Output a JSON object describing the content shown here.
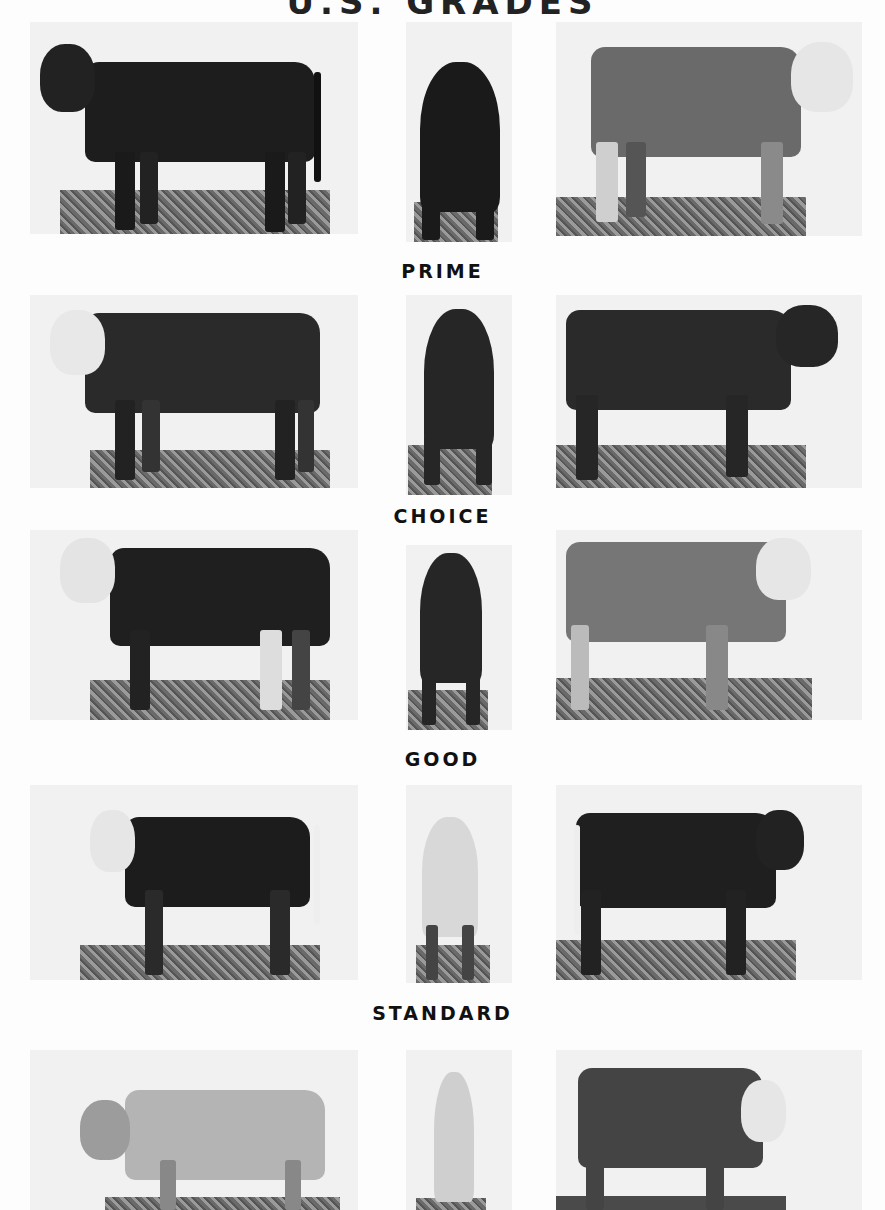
{
  "page": {
    "title": "U.S. GRADES",
    "title_cropped": true
  },
  "grades": [
    {
      "label": "PRIME",
      "row": 1,
      "label_position": "below_row_1",
      "photos": [
        {
          "view": "side-left",
          "coat": "black"
        },
        {
          "view": "rear",
          "coat": "black"
        },
        {
          "view": "side-right",
          "coat": "roan-whiteface"
        }
      ]
    },
    {
      "label": "CHOICE",
      "row": 2,
      "label_position": "below_row_2",
      "photos": [
        {
          "view": "side-left",
          "coat": "hereford-whiteface"
        },
        {
          "view": "rear",
          "coat": "dark"
        },
        {
          "view": "side-right",
          "coat": "black"
        }
      ]
    },
    {
      "label": "GOOD",
      "row": 3,
      "label_position": "below_row_3",
      "photos": [
        {
          "view": "side-left",
          "coat": "hereford-whiteface"
        },
        {
          "view": "rear",
          "coat": "dark"
        },
        {
          "view": "side-right",
          "coat": "gray-whiteface"
        }
      ]
    },
    {
      "label": "STANDARD",
      "row": 4,
      "label_position": "below_row_4",
      "photos": [
        {
          "view": "side-left",
          "coat": "black-whiteface"
        },
        {
          "view": "rear",
          "coat": "light"
        },
        {
          "view": "side-right",
          "coat": "black"
        }
      ]
    },
    {
      "label": "",
      "row": 5,
      "label_position": "none-visible",
      "photos": [
        {
          "view": "side-left",
          "coat": "light-gray"
        },
        {
          "view": "rear",
          "coat": "light"
        },
        {
          "view": "side-right",
          "coat": "gray-whiteface"
        }
      ]
    }
  ],
  "labels": {
    "prime": "PRIME",
    "choice": "CHOICE",
    "good": "GOOD",
    "standard": "STANDARD"
  }
}
